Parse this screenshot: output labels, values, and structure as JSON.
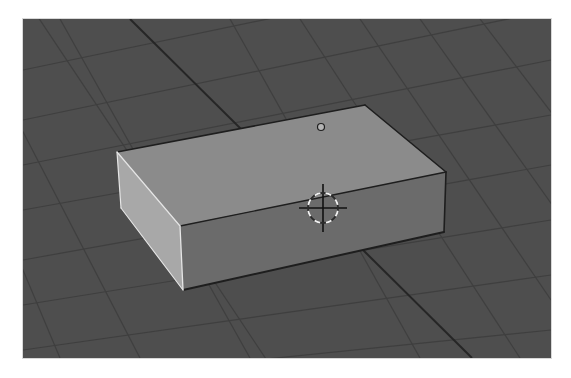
{
  "viewport": {
    "name": "3D Viewport",
    "offset": {
      "x": 23,
      "y": 19
    },
    "size": {
      "w": 528,
      "h": 339
    },
    "colors": {
      "background": "#4e4e4e",
      "grid_minor": "#3f3f3f",
      "grid_major": "#262626",
      "face_top": "#8b8b8b",
      "face_front": "#6b6b6b",
      "face_side": "#a8a8a8",
      "edge_dark": "#1e1e1e",
      "edge_highlight": "#e6e6e6",
      "origin_fill": "#b4b4b4",
      "origin_stroke": "#1e1e1e",
      "cursor_cross": "#111111",
      "cursor_ring_a": "#f2f2f2",
      "cursor_ring_b": "#2a2a2a"
    }
  },
  "scene": {
    "grid": {
      "family_steep": [
        [
          [
            -40,
            10
          ],
          [
            140,
            358
          ]
        ],
        [
          [
            20,
            -10
          ],
          [
            280,
            380
          ]
        ],
        [
          [
            60,
            19
          ],
          [
            250,
            358
          ]
        ],
        [
          [
            230,
            19
          ],
          [
            420,
            358
          ]
        ],
        [
          [
            300,
            19
          ],
          [
            520,
            358
          ]
        ],
        [
          [
            360,
            19
          ],
          [
            551,
            300
          ]
        ],
        [
          [
            420,
            19
          ],
          [
            570,
            230
          ]
        ],
        [
          [
            480,
            19
          ],
          [
            580,
            150
          ]
        ],
        [
          [
            -40,
            120
          ],
          [
            60,
            358
          ]
        ]
      ],
      "family_shallow": [
        [
          [
            23,
            70
          ],
          [
            551,
            -40
          ]
        ],
        [
          [
            23,
            120
          ],
          [
            551,
            10
          ]
        ],
        [
          [
            23,
            165
          ],
          [
            551,
            60
          ]
        ],
        [
          [
            23,
            210
          ],
          [
            551,
            115
          ]
        ],
        [
          [
            23,
            260
          ],
          [
            551,
            165
          ]
        ],
        [
          [
            23,
            305
          ],
          [
            551,
            220
          ]
        ],
        [
          [
            23,
            350
          ],
          [
            551,
            275
          ]
        ],
        [
          [
            60,
            380
          ],
          [
            551,
            330
          ]
        ]
      ],
      "axis_major": [
        [
          130,
          19
        ],
        [
          472,
          358
        ]
      ]
    },
    "box": {
      "vertices": {
        "top_back_left": [
          117,
          152
        ],
        "top_back_right": [
          365,
          105
        ],
        "top_front_right": [
          446,
          172
        ],
        "top_front_left": [
          180,
          226
        ],
        "bot_back_left": [
          121,
          208
        ],
        "bot_front_left": [
          183,
          290
        ],
        "bot_front_right": [
          444,
          232
        ]
      }
    },
    "origin": {
      "x": 321,
      "y": 127,
      "r": 3.5
    },
    "cursor_3d": {
      "x": 323,
      "y": 208,
      "ring_r": 15,
      "cross_len": 24,
      "dashes": 8
    }
  }
}
